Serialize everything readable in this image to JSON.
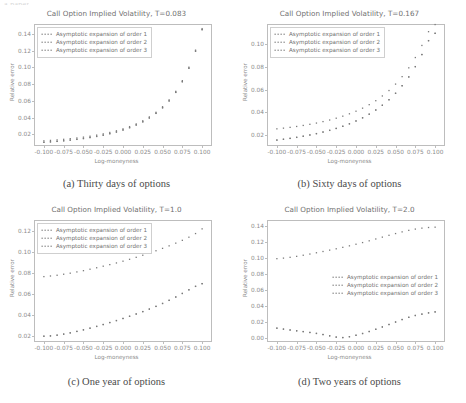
{
  "page": {
    "cutoff_header": "a paper"
  },
  "series_names": [
    "Asymptotic expansion of order 1",
    "Asymptotic expansion of order 2",
    "Asymptotic expansion of order 3"
  ],
  "axis": {
    "xlabel": "Log-moneyness",
    "ylabel": "Relative error",
    "xticks": [
      "-0.100",
      "-0.075",
      "-0.050",
      "-0.025",
      "0.000",
      "0.025",
      "0.050",
      "0.075",
      "0.100"
    ],
    "xlim": [
      -0.1125,
      0.1125
    ]
  },
  "panels": [
    {
      "key": "a",
      "caption": "(a) Thirty days of options",
      "title": "Call Option Implied Volatility, T=0.083",
      "legend_position": "upper-left",
      "legend_boxed": true,
      "yticks": [
        "0.02",
        "0.04",
        "0.06",
        "0.08",
        "0.10",
        "0.12",
        "0.14"
      ]
    },
    {
      "key": "b",
      "caption": "(b) Sixty days of options",
      "title": "Call Option Implied Volatility, T=0.167",
      "legend_position": "upper-left",
      "legend_boxed": true,
      "yticks": [
        "0.02",
        "0.04",
        "0.06",
        "0.08",
        "0.10"
      ]
    },
    {
      "key": "c",
      "caption": "(c) One year of options",
      "title": "Call Option Implied Volatility, T=1.0",
      "legend_position": "upper-left",
      "legend_boxed": true,
      "yticks": [
        "0.02",
        "0.04",
        "0.06",
        "0.08",
        "0.10",
        "0.12"
      ]
    },
    {
      "key": "d",
      "caption": "(d) Two years of options",
      "title": "Call Option Implied Volatility, T=2.0",
      "legend_position": "middle-right",
      "legend_boxed": false,
      "yticks": [
        "0.00",
        "0.02",
        "0.04",
        "0.06",
        "0.08",
        "0.10",
        "0.12",
        "0.14"
      ]
    }
  ],
  "chart_data": [
    {
      "type": "scatter",
      "panel": "a",
      "title": "Call Option Implied Volatility, T=0.083",
      "xlabel": "Log-moneyness",
      "ylabel": "Relative error",
      "xlim": [
        -0.1125,
        0.1125
      ],
      "ylim": [
        0.006,
        0.152
      ],
      "grid": false,
      "legend": "upper left",
      "x": [
        -0.1,
        -0.0917,
        -0.0833,
        -0.075,
        -0.0667,
        -0.0583,
        -0.05,
        -0.0417,
        -0.0333,
        -0.025,
        -0.0167,
        -0.0083,
        0.0,
        0.0083,
        0.0167,
        0.025,
        0.0333,
        0.0417,
        0.05,
        0.0583,
        0.0667,
        0.075,
        0.0833,
        0.0917,
        0.1
      ],
      "series": [
        {
          "name": "Asymptotic expansion of order 1",
          "values": [
            0.0122,
            0.0127,
            0.0133,
            0.014,
            0.0148,
            0.0156,
            0.0166,
            0.0177,
            0.019,
            0.0205,
            0.0222,
            0.0242,
            0.0265,
            0.0292,
            0.0324,
            0.0362,
            0.0408,
            0.0463,
            0.053,
            0.0612,
            0.0714,
            0.0842,
            0.1003,
            0.1207,
            0.1465
          ]
        },
        {
          "name": "Asymptotic expansion of order 2",
          "values": [
            0.0105,
            0.011,
            0.0116,
            0.0123,
            0.0131,
            0.014,
            0.015,
            0.0162,
            0.0175,
            0.019,
            0.0208,
            0.0228,
            0.0252,
            0.028,
            0.0312,
            0.035,
            0.0396,
            0.0451,
            0.0518,
            0.06,
            0.0702,
            0.083,
            0.0991,
            0.1195,
            0.1453
          ]
        },
        {
          "name": "Asymptotic expansion of order 3",
          "values": [
            0.0104,
            0.0109,
            0.0115,
            0.0122,
            0.013,
            0.0139,
            0.0149,
            0.0161,
            0.0174,
            0.0189,
            0.0207,
            0.0227,
            0.0251,
            0.0279,
            0.0311,
            0.0349,
            0.0395,
            0.045,
            0.0517,
            0.0599,
            0.0701,
            0.0829,
            0.099,
            0.1194,
            0.1452
          ]
        }
      ]
    },
    {
      "type": "scatter",
      "panel": "b",
      "title": "Call Option Implied Volatility, T=0.167",
      "xlabel": "Log-moneyness",
      "ylabel": "Relative error",
      "xlim": [
        -0.1125,
        0.1125
      ],
      "ylim": [
        0.01,
        0.118
      ],
      "grid": false,
      "legend": "upper left",
      "x": [
        -0.1,
        -0.0917,
        -0.0833,
        -0.075,
        -0.0667,
        -0.0583,
        -0.05,
        -0.0417,
        -0.0333,
        -0.025,
        -0.0167,
        -0.0083,
        0.0,
        0.0083,
        0.0167,
        0.025,
        0.0333,
        0.0417,
        0.05,
        0.0583,
        0.0667,
        0.075,
        0.0833,
        0.0917,
        0.1
      ],
      "series": [
        {
          "name": "Asymptotic expansion of order 1",
          "values": [
            0.0252,
            0.0258,
            0.0265,
            0.0273,
            0.0282,
            0.0292,
            0.0303,
            0.0316,
            0.033,
            0.0346,
            0.0364,
            0.0385,
            0.0408,
            0.0435,
            0.0466,
            0.0501,
            0.0543,
            0.0591,
            0.0648,
            0.0714,
            0.0792,
            0.0883,
            0.099,
            0.1112,
            0.1175
          ]
        },
        {
          "name": "Asymptotic expansion of order 2",
          "values": [
            0.0153,
            0.016,
            0.0168,
            0.0177,
            0.0187,
            0.0198,
            0.021,
            0.0224,
            0.0239,
            0.0256,
            0.0275,
            0.0297,
            0.0322,
            0.035,
            0.0382,
            0.0419,
            0.0461,
            0.051,
            0.0567,
            0.0634,
            0.0712,
            0.0803,
            0.091,
            0.1033,
            0.1098
          ]
        },
        {
          "name": "Asymptotic expansion of order 3",
          "values": [
            0.0152,
            0.0159,
            0.0167,
            0.0176,
            0.0186,
            0.0197,
            0.0209,
            0.0223,
            0.0238,
            0.0255,
            0.0274,
            0.0296,
            0.0321,
            0.0349,
            0.0381,
            0.0418,
            0.046,
            0.0509,
            0.0566,
            0.0633,
            0.0711,
            0.0802,
            0.0909,
            0.1032,
            0.1097
          ]
        }
      ]
    },
    {
      "type": "scatter",
      "panel": "c",
      "title": "Call Option Implied Volatility, T=1.0",
      "xlabel": "Log-moneyness",
      "ylabel": "Relative error",
      "xlim": [
        -0.1125,
        0.1125
      ],
      "ylim": [
        0.014,
        0.131
      ],
      "grid": false,
      "legend": "upper left",
      "x": [
        -0.1,
        -0.0917,
        -0.0833,
        -0.075,
        -0.0667,
        -0.0583,
        -0.05,
        -0.0417,
        -0.0333,
        -0.025,
        -0.0167,
        -0.0083,
        0.0,
        0.0083,
        0.0167,
        0.025,
        0.0333,
        0.0417,
        0.05,
        0.0583,
        0.0667,
        0.075,
        0.0833,
        0.0917,
        0.1
      ],
      "series": [
        {
          "name": "Asymptotic expansion of order 1",
          "values": [
            0.0767,
            0.0773,
            0.078,
            0.079,
            0.08,
            0.0812,
            0.0824,
            0.0838,
            0.0852,
            0.0867,
            0.0882,
            0.0898,
            0.0915,
            0.0933,
            0.0952,
            0.0972,
            0.0993,
            0.1015,
            0.1038,
            0.1062,
            0.1088,
            0.1115,
            0.1145,
            0.118,
            0.1225
          ]
        },
        {
          "name": "Asymptotic expansion of order 2",
          "values": [
            0.0196,
            0.0199,
            0.0206,
            0.0216,
            0.0228,
            0.0242,
            0.0257,
            0.0273,
            0.029,
            0.0308,
            0.0327,
            0.0346,
            0.0366,
            0.0387,
            0.0409,
            0.0432,
            0.0456,
            0.0482,
            0.051,
            0.054,
            0.0572,
            0.0606,
            0.0641,
            0.0674,
            0.07
          ]
        },
        {
          "name": "Asymptotic expansion of order 3",
          "values": [
            0.0195,
            0.0198,
            0.0205,
            0.0215,
            0.0227,
            0.0241,
            0.0256,
            0.0272,
            0.0289,
            0.0307,
            0.0326,
            0.0345,
            0.0365,
            0.0386,
            0.0408,
            0.0431,
            0.0455,
            0.0481,
            0.0509,
            0.0539,
            0.0571,
            0.0605,
            0.064,
            0.0673,
            0.0699
          ]
        }
      ]
    },
    {
      "type": "scatter",
      "panel": "d",
      "title": "Call Option Implied Volatility, T=2.0",
      "xlabel": "Log-moneyness",
      "ylabel": "Relative error",
      "xlim": [
        -0.1125,
        0.1125
      ],
      "ylim": [
        -0.005,
        0.148
      ],
      "grid": false,
      "legend": "center right",
      "x": [
        -0.1,
        -0.0917,
        -0.0833,
        -0.075,
        -0.0667,
        -0.0583,
        -0.05,
        -0.0417,
        -0.0333,
        -0.025,
        -0.0167,
        -0.0083,
        0.0,
        0.0083,
        0.0167,
        0.025,
        0.0333,
        0.0417,
        0.05,
        0.0583,
        0.0667,
        0.075,
        0.0833,
        0.0917,
        0.1
      ],
      "series": [
        {
          "name": "Asymptotic expansion of order 1",
          "values": [
            0.0995,
            0.1002,
            0.1012,
            0.1024,
            0.1038,
            0.1053,
            0.1069,
            0.1085,
            0.1102,
            0.1119,
            0.1137,
            0.1156,
            0.1176,
            0.1197,
            0.1219,
            0.1242,
            0.1265,
            0.1288,
            0.131,
            0.1331,
            0.135,
            0.1366,
            0.1378,
            0.1386,
            0.139
          ]
        },
        {
          "name": "Asymptotic expansion of order 2",
          "values": [
            0.0124,
            0.0112,
            0.0101,
            0.0091,
            0.0081,
            0.007,
            0.0058,
            0.0044,
            0.0028,
            0.0012,
            0.0006,
            0.0017,
            0.0035,
            0.0057,
            0.0082,
            0.011,
            0.0139,
            0.017,
            0.0201,
            0.0232,
            0.026,
            0.0283,
            0.03,
            0.0316,
            0.0328
          ]
        },
        {
          "name": "Asymptotic expansion of order 3",
          "values": [
            0.0123,
            0.0111,
            0.01,
            0.009,
            0.008,
            0.0069,
            0.0057,
            0.0043,
            0.0027,
            0.0011,
            0.0005,
            0.0016,
            0.0034,
            0.0056,
            0.0081,
            0.0109,
            0.0138,
            0.0169,
            0.02,
            0.0231,
            0.0259,
            0.0282,
            0.0299,
            0.0315,
            0.0327
          ]
        }
      ]
    }
  ]
}
